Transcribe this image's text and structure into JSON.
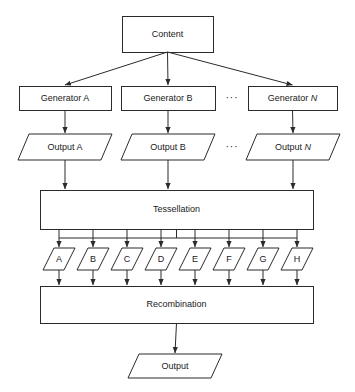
{
  "diagram": {
    "colors": {
      "stroke": "#2b2b2b",
      "fill": "#ffffff",
      "text": "#1a1a1a",
      "background": "#ffffff"
    },
    "nodes": {
      "content": {
        "label": "Content",
        "shape": "rectangle",
        "x": 122,
        "y": 16,
        "w": 91,
        "h": 36
      },
      "generators": [
        {
          "label": "Generator A",
          "italic_tail": "",
          "shape": "rectangle",
          "x": 19,
          "y": 86,
          "w": 92,
          "h": 24
        },
        {
          "label": "Generator B",
          "italic_tail": "",
          "shape": "rectangle",
          "x": 121,
          "y": 86,
          "w": 94,
          "h": 24
        },
        {
          "label": "Generator ",
          "italic_tail": "N",
          "shape": "rectangle",
          "x": 248,
          "y": 86,
          "w": 89,
          "h": 24
        }
      ],
      "outputs": [
        {
          "label": "Output A",
          "italic_tail": "",
          "shape": "parallelogram",
          "x": 18,
          "y": 134,
          "w": 94,
          "h": 26
        },
        {
          "label": "Output B",
          "italic_tail": "",
          "shape": "parallelogram",
          "x": 121,
          "y": 134,
          "w": 94,
          "h": 26
        },
        {
          "label": "Output ",
          "italic_tail": "N",
          "shape": "parallelogram",
          "x": 246,
          "y": 134,
          "w": 94,
          "h": 26
        }
      ],
      "tessellation": {
        "label": "Tessellation",
        "shape": "rectangle",
        "x": 40,
        "y": 190,
        "w": 273,
        "h": 39
      },
      "tiles": [
        {
          "label": "A",
          "shape": "parallelogram",
          "x": 43,
          "y": 248,
          "w": 32,
          "h": 22
        },
        {
          "label": "B",
          "shape": "parallelogram",
          "x": 77,
          "y": 248,
          "w": 32,
          "h": 22
        },
        {
          "label": "C",
          "shape": "parallelogram",
          "x": 111,
          "y": 248,
          "w": 32,
          "h": 22
        },
        {
          "label": "D",
          "shape": "parallelogram",
          "x": 145,
          "y": 248,
          "w": 32,
          "h": 22
        },
        {
          "label": "E",
          "shape": "parallelogram",
          "x": 179,
          "y": 248,
          "w": 32,
          "h": 22
        },
        {
          "label": "F",
          "shape": "parallelogram",
          "x": 213,
          "y": 248,
          "w": 32,
          "h": 22
        },
        {
          "label": "G",
          "shape": "parallelogram",
          "x": 247,
          "y": 248,
          "w": 32,
          "h": 22
        },
        {
          "label": "H",
          "shape": "parallelogram",
          "x": 281,
          "y": 248,
          "w": 32,
          "h": 22
        }
      ],
      "recombination": {
        "label": "Recombination",
        "shape": "rectangle",
        "x": 40,
        "y": 286,
        "w": 273,
        "h": 37
      },
      "final_output": {
        "label": "Output",
        "shape": "parallelogram",
        "x": 128,
        "y": 354,
        "w": 94,
        "h": 24
      }
    },
    "ellipses": [
      {
        "label": "···",
        "x": 232,
        "y": 98
      },
      {
        "label": "···",
        "x": 232,
        "y": 147
      }
    ]
  }
}
